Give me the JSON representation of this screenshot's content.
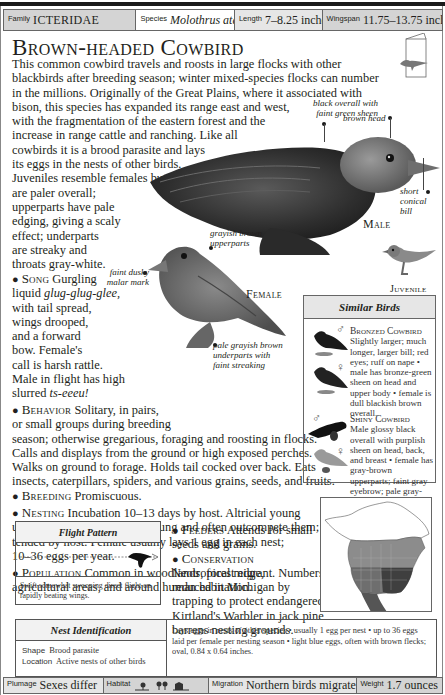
{
  "header": {
    "family": {
      "label": "Family",
      "value": "ICTERIDAE"
    },
    "species": {
      "label": "Species",
      "value": "Molothrus ater"
    },
    "length": {
      "label": "Length",
      "value": "7–8.25 inches"
    },
    "wingspan": {
      "label": "Wingspan",
      "value": "11.75–13.75 inches"
    }
  },
  "title": "Brown-headed Cowbird",
  "intro_lines": [
    "This common cowbird travels and roosts in large flocks with other",
    "blackbirds after breeding season; winter mixed-species flocks can number",
    "in the millions. Originally of the Great Plains, where it associated with",
    "bison, this species has expanded its range east and west,",
    "with the fragmentation of the eastern forest and the",
    "increase in range cattle and ranching. Like all",
    "cowbirds it is a brood parasite and lays",
    "its eggs in the nests of other birds.",
    "Juveniles resemble females but",
    "are paler overall;",
    "upperparts have pale",
    "edging, giving a scaly",
    "effect; underparts",
    "are streaky and",
    "throats gray-white."
  ],
  "song": {
    "head": "Song",
    "lines": [
      "Gurgling",
      "liquid",
      "with tail spread,",
      "wings drooped,",
      "and a forward",
      "bow. Female's",
      "call is harsh rattle.",
      "Male in flight has high",
      "slurred"
    ],
    "call1": "glug-glug-glee,",
    "call2": "ts-eeeu!"
  },
  "behavior": {
    "head": "Behavior",
    "lines": [
      "Solitary, in pairs,",
      "or small groups during breeding",
      "season; otherwise gregarious, foraging and roosting in flocks.",
      "Calls and displays from the ground or high exposed perches.",
      "Walks on ground to forage. Holds tail cocked over back. Eats",
      "insects, caterpillars, spiders, and various grains, seeds, and fruits."
    ]
  },
  "breeding": {
    "head": "Breeding",
    "text": "Promiscuous."
  },
  "nesting": {
    "head": "Nesting",
    "lines": [
      "Incubation 10–13 days by host. Altricial young",
      "usually hatch before host's young and often outcompete them;",
      "tended by host. Female usually lays 1 egg in each nest;",
      "10–36 eggs per year."
    ]
  },
  "population": {
    "head": "Population",
    "lines": [
      "Common in woodlands, forest edge,",
      "agricultural areas, and around human habitation."
    ]
  },
  "feeders": {
    "head": "Feeders",
    "lines": [
      "Attends for small",
      "seeds and grains."
    ]
  },
  "conservation": {
    "head": "Conservation",
    "lines": [
      "Neotropical migrant. Numbers",
      "reduced in Michigan by",
      "trapping to protect endangered",
      "Kirtland's Warbler in jack pine",
      "barrens nesting grounds."
    ]
  },
  "illustrations": {
    "male": {
      "caption": "Male",
      "callouts": [
        "black overall with faint green sheen",
        "brown head",
        "short conical bill"
      ]
    },
    "female": {
      "caption": "Female",
      "callouts": [
        "grayish brown upperparts",
        "faint dusky malar mark",
        "pale grayish brown underparts with faint streaking"
      ]
    },
    "juvenile": {
      "caption": "Juvenile"
    }
  },
  "similar_birds": {
    "title": "Similar Birds",
    "entries": [
      {
        "name": "Bronzed Cowbird",
        "text": "Slightly larger; much longer, larger bill; red eyes; ruff on nape • male has bronze-green sheen on head and upper body • female is dull blackish brown overall.",
        "sex_symbols": [
          "♂",
          "♀"
        ]
      },
      {
        "name": "Shiny Cowbird",
        "text": "Male glossy black overall with purplish sheen on head, back, and breast • female has gray-brown upperparts; faint gray eyebrow; pale gray-brown underparts; paler gray throat.",
        "sex_symbols": [
          "♂",
          "♀"
        ]
      }
    ]
  },
  "flight_pattern": {
    "title": "Flight Pattern",
    "description": "Swift somewhat swooping direct flight on rapidly beating wings."
  },
  "nest_id": {
    "title": "Nest Identification",
    "shape": {
      "label": "Shape",
      "value": "Brood parasite"
    },
    "location": {
      "label": "Location",
      "value": "Active nests of other birds"
    },
    "description": "Lays eggs in nests of other species • usually 1 egg per nest • up to 36 eggs laid per female per nesting season • light blue eggs, often with brown flecks; oval, 0.84 x 0.64 inches."
  },
  "footer": {
    "plumage": {
      "label": "Plumage",
      "value": "Sexes differ"
    },
    "habitat": {
      "label": "Habitat",
      "icons": [
        "open-country-icon",
        "woodland-edge-icon",
        "farmland-icon"
      ]
    },
    "migration": {
      "label": "Migration",
      "value": "Northern birds migrate"
    },
    "weight": {
      "label": "Weight",
      "value": "1.7 ounces"
    }
  },
  "colors": {
    "text": "#231f20",
    "bar_dark": "#d4d4d4",
    "bar_light": "#e6e6e6",
    "map_summer": "#8c8c8c",
    "map_year_round": "#4a4a4a",
    "map_winter": "#6e6e6e"
  }
}
